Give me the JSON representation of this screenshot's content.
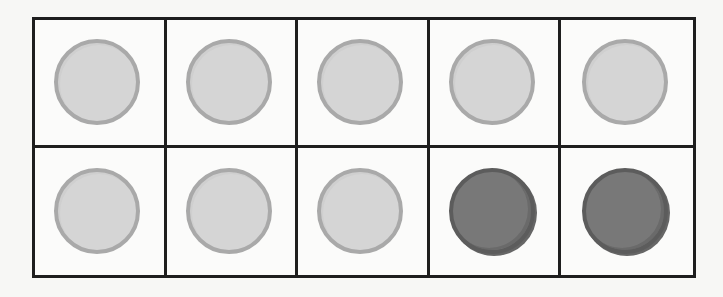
{
  "ten_frame": {
    "rows": 2,
    "columns": 5,
    "total_cells": 10,
    "cells": [
      {
        "row": 1,
        "col": 1,
        "counter": "light"
      },
      {
        "row": 1,
        "col": 2,
        "counter": "light"
      },
      {
        "row": 1,
        "col": 3,
        "counter": "light"
      },
      {
        "row": 1,
        "col": 4,
        "counter": "light"
      },
      {
        "row": 1,
        "col": 5,
        "counter": "light"
      },
      {
        "row": 2,
        "col": 1,
        "counter": "light"
      },
      {
        "row": 2,
        "col": 2,
        "counter": "light"
      },
      {
        "row": 2,
        "col": 3,
        "counter": "light"
      },
      {
        "row": 2,
        "col": 4,
        "counter": "dark"
      },
      {
        "row": 2,
        "col": 5,
        "counter": "dark"
      }
    ],
    "counts": {
      "light": 8,
      "dark": 2,
      "empty": 0
    },
    "colors": {
      "grid_line": "#1e1e1e",
      "light_fill": "#d5d5d5",
      "light_rim": "#a9a9a9",
      "dark_fill": "#787878",
      "dark_rim": "#5c5c5c",
      "background": "#f7f7f5"
    }
  }
}
